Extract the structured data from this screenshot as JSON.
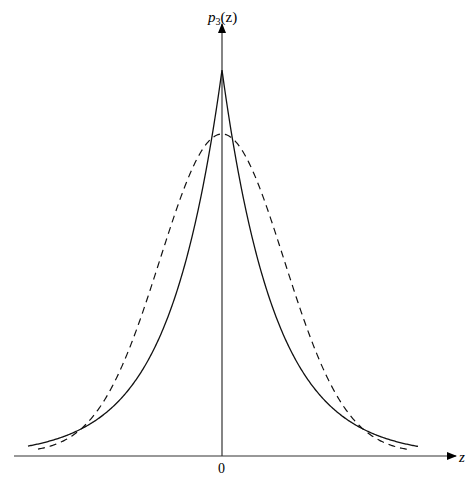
{
  "chart_data": {
    "type": "line",
    "title": "",
    "xlabel": "z",
    "ylabel": "p3(z)",
    "ylabel_display": {
      "base": "p",
      "sub": "3",
      "arg": "(z)"
    },
    "x_tick_labels": [
      "0"
    ],
    "grid": false,
    "legend": null,
    "series": [
      {
        "name": "solid (Laplace-like, sharp peak)",
        "style": "solid",
        "peak_height_px": 386,
        "scale_px": 53
      },
      {
        "name": "dashed (Gaussian-like)",
        "style": "dashed",
        "peak_height_px": 322,
        "sigma_px": 62
      }
    ]
  }
}
